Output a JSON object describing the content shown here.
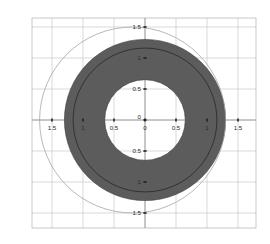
{
  "chart_data": {
    "type": "scatter",
    "title": "",
    "subtitle": "",
    "xlabel": "",
    "ylabel": "",
    "xlim": [
      -2.17,
      -0.0
    ],
    "ylim": [
      -1.72,
      1.72
    ],
    "grid": true,
    "legend": null,
    "background": "#ffffff",
    "frame_color": "#b9b9b9",
    "grid_color": "#c9c9c9",
    "axis_color": "#9a9a9a",
    "xticks": [
      -2,
      -1.5,
      -1,
      -0.5,
      0,
      0.5,
      1,
      1.5
    ],
    "xticklabels": [
      "2",
      "1.5",
      "1",
      "0.5",
      "0",
      "0.5",
      "1",
      "1.5"
    ],
    "yticks": [
      1.5,
      1,
      0.5,
      0,
      -0.5,
      -1,
      -1.5
    ],
    "yticklabels": [
      "1.5",
      "1",
      "0.5",
      "0",
      "0.5",
      "1",
      "1.5"
    ],
    "origin_label": "0",
    "series": [
      {
        "name": "filled-annulus",
        "shape": "annulus",
        "cx": 0,
        "cy": 0,
        "outer_radius": 1.3,
        "inner_radius": 0.65,
        "fill": "#5c5c5c",
        "stroke": "#3a3a3a",
        "stroke_width": 0.6
      },
      {
        "name": "outer-open-circle",
        "shape": "circle",
        "cx": -0.2,
        "cy": 0,
        "radius": 1.5,
        "fill": "none",
        "stroke": "#a6a6a6",
        "stroke_width": 0.8
      },
      {
        "name": "inner-dashed-arc",
        "shape": "circle",
        "cx": 0,
        "cy": 0,
        "radius": 1.16,
        "fill": "none",
        "stroke": "#1f1f1f",
        "stroke_width": 0.7
      }
    ]
  },
  "plot": {
    "frame": {
      "x0": 32,
      "y0": 18,
      "x1": 256,
      "y1": 228
    },
    "origin_px": {
      "x": 145,
      "y": 120
    },
    "px_per_unit": 62.0
  }
}
